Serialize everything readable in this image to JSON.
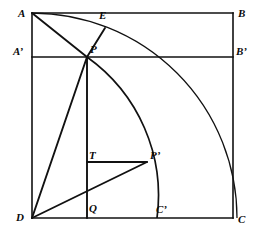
{
  "figure": {
    "kind": "geometric-construction-diagram",
    "width": 256,
    "height": 234,
    "background_color": "#ffffff",
    "stroke_color": "#111111",
    "label_color": "#0a0a0a"
  },
  "labels": {
    "A": "A",
    "B": "B",
    "C": "C",
    "D": "D",
    "E": "E",
    "P": "P",
    "T": "T",
    "Q": "Q",
    "A_prime": "A’",
    "B_prime": "B’",
    "C_prime": "C’",
    "P_prime": "P’"
  },
  "points": {
    "A": {
      "x": 32,
      "y": 13,
      "label": "A",
      "label_x": 18,
      "label_y": 8
    },
    "B": {
      "x": 233,
      "y": 13,
      "label": "B",
      "label_x": 238,
      "label_y": 8
    },
    "C": {
      "x": 233,
      "y": 218,
      "label": "C",
      "label_x": 238,
      "label_y": 214
    },
    "D": {
      "x": 32,
      "y": 218,
      "label": "D",
      "label_x": 16,
      "label_y": 212
    },
    "A_prime": {
      "x": 32,
      "y": 57,
      "label": "A’",
      "label_x": 13,
      "label_y": 46
    },
    "B_prime": {
      "x": 233,
      "y": 57,
      "label": "B’",
      "label_x": 236,
      "label_y": 46
    },
    "C_prime": {
      "x": 157,
      "y": 218,
      "label": "C’",
      "label_x": 156,
      "label_y": 204
    },
    "P": {
      "x": 87,
      "y": 57,
      "label": "P",
      "label_x": 90,
      "label_y": 44
    },
    "P_prime": {
      "x": 147,
      "y": 162,
      "label": "P’",
      "label_x": 150,
      "label_y": 150
    },
    "E": {
      "x": 105,
      "y": 28,
      "label": "E",
      "label_x": 99,
      "label_y": 10
    },
    "T": {
      "x": 87,
      "y": 162,
      "label": "T",
      "label_x": 89,
      "label_y": 150
    },
    "Q": {
      "x": 87,
      "y": 218,
      "label": "Q",
      "label_x": 89,
      "label_y": 203
    }
  },
  "segments": [
    {
      "name": "square-side-AB",
      "from": "A",
      "to": "B",
      "width": 1.6
    },
    {
      "name": "square-side-BC",
      "from": "B",
      "to": "C",
      "width": 1.6
    },
    {
      "name": "square-side-CD",
      "from": "C",
      "to": "D",
      "width": 1.6
    },
    {
      "name": "square-side-DA",
      "from": "D",
      "to": "A",
      "width": 1.6
    },
    {
      "name": "chord-A-prime-B-prime",
      "from": "A_prime",
      "to": "B_prime",
      "width": 1.6
    },
    {
      "name": "segment-A-to-P",
      "from": "A",
      "to": "P",
      "width": 1.8
    },
    {
      "name": "segment-P-to-E",
      "from": "P",
      "to": "E",
      "width": 1.8
    },
    {
      "name": "segment-D-to-P",
      "from": "D",
      "to": "P",
      "width": 1.8
    },
    {
      "name": "segment-P-to-Q",
      "from": "P",
      "to": "Q",
      "width": 1.8
    },
    {
      "name": "segment-D-to-P-prime",
      "from": "D",
      "to": "P_prime",
      "width": 1.8
    },
    {
      "name": "segment-T-to-P-prime",
      "from": "T",
      "to": "P_prime",
      "width": 1.8
    }
  ],
  "arcs": [
    {
      "name": "outer-quarter-arc-A-to-C",
      "center": "D",
      "radius": 205,
      "from": "A",
      "to": "C",
      "width": 1.3,
      "description": "quarter circle centered at D from A to C passing through E"
    },
    {
      "name": "inner-arc-P-to-C-prime",
      "center": "D",
      "radius": 170,
      "from": "P",
      "to": "C_prime",
      "width": 1.6,
      "description": "arc centered at D from P through P-prime to C-prime"
    }
  ]
}
